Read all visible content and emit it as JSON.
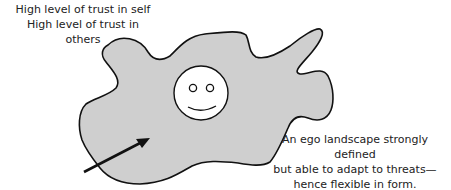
{
  "top_label": {
    "line1": "High level of trust in self",
    "line2": "High level of trust in others"
  },
  "bottom_label": {
    "line1": "An ego landscape strongly defined",
    "line2": "but able to adapt to threats—",
    "line3": "hence flexible in form."
  },
  "colors": {
    "blob_fill": "#cfcfcf",
    "outline": "#111111",
    "face_fill": "#ffffff"
  },
  "icons": {
    "face": "smiley-face",
    "pointer": "arrow"
  }
}
